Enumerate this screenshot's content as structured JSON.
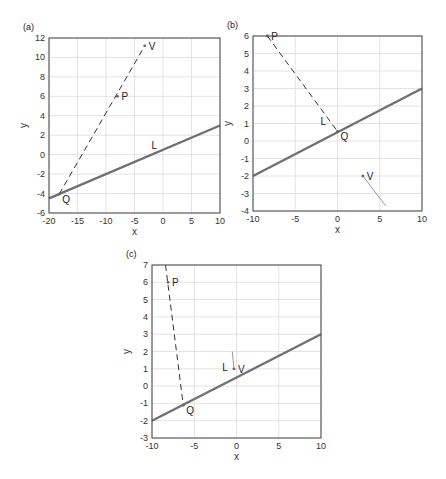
{
  "chart_data": [
    {
      "type": "line",
      "panel_label": "(a)",
      "xlabel": "x",
      "ylabel": "y",
      "xlim": [
        -20,
        10
      ],
      "ylim": [
        -6,
        12
      ],
      "xticks": [
        -20,
        -15,
        -10,
        -5,
        0,
        5,
        10
      ],
      "yticks": [
        -6,
        -4,
        -2,
        0,
        2,
        4,
        6,
        8,
        10,
        12
      ],
      "grid": true,
      "series": [
        {
          "name": "L",
          "style": "solid-thick",
          "color": "#707070",
          "points": [
            [
              -20,
              -4.5
            ],
            [
              10,
              3
            ]
          ]
        },
        {
          "name": "PQ",
          "style": "dashed",
          "color": "#333333",
          "points": [
            [
              -18.2,
              -4.05
            ],
            [
              -3.2,
              11.2
            ]
          ]
        }
      ],
      "annotations": [
        {
          "text": "V",
          "x": -3.2,
          "y": 11.2,
          "marker": true
        },
        {
          "text": "P",
          "x": -8,
          "y": 6,
          "marker": true
        },
        {
          "text": "L",
          "x": -2,
          "y": 0.6,
          "marker": false
        },
        {
          "text": "Q",
          "x": -18.2,
          "y": -4.05,
          "marker": true
        }
      ]
    },
    {
      "type": "line",
      "panel_label": "(b)",
      "xlabel": "x",
      "ylabel": "y",
      "xlim": [
        -10,
        10
      ],
      "ylim": [
        -4,
        6
      ],
      "xticks": [
        -10,
        -5,
        0,
        5,
        10
      ],
      "yticks": [
        -4,
        -3,
        -2,
        -1,
        0,
        1,
        2,
        3,
        4,
        5,
        6
      ],
      "grid": true,
      "series": [
        {
          "name": "L",
          "style": "solid-thick",
          "color": "#707070",
          "points": [
            [
              -10,
              -2
            ],
            [
              10,
              3
            ]
          ]
        },
        {
          "name": "PQ",
          "style": "dashed",
          "color": "#333333",
          "points": [
            [
              -8.3,
              6
            ],
            [
              0,
              0.55
            ]
          ]
        },
        {
          "name": "V-segment",
          "style": "solid-thin",
          "color": "#999999",
          "points": [
            [
              3,
              -2
            ],
            [
              5.7,
              -3.7
            ]
          ]
        }
      ],
      "annotations": [
        {
          "text": "P",
          "x": -8.3,
          "y": 6,
          "marker": true
        },
        {
          "text": "L",
          "x": -2,
          "y": 0.9,
          "marker": false
        },
        {
          "text": "Q",
          "x": 0,
          "y": 0.55,
          "marker": true
        },
        {
          "text": "V",
          "x": 3,
          "y": -2,
          "marker": true
        }
      ]
    },
    {
      "type": "line",
      "panel_label": "(c)",
      "xlabel": "x",
      "ylabel": "y",
      "xlim": [
        -10,
        10
      ],
      "ylim": [
        -3,
        7
      ],
      "xticks": [
        -10,
        -5,
        0,
        5,
        10
      ],
      "yticks": [
        -3,
        -2,
        -1,
        0,
        1,
        2,
        3,
        4,
        5,
        6,
        7
      ],
      "grid": true,
      "series": [
        {
          "name": "L",
          "style": "solid-thick",
          "color": "#707070",
          "points": [
            [
              -10,
              -2
            ],
            [
              10,
              3
            ]
          ]
        },
        {
          "name": "PQ",
          "style": "dashed",
          "color": "#333333",
          "points": [
            [
              -8.4,
              7
            ],
            [
              -6.3,
              -1.1
            ]
          ]
        },
        {
          "name": "V-segment",
          "style": "solid-thin",
          "color": "#999999",
          "points": [
            [
              -0.5,
              2
            ],
            [
              -0.3,
              1
            ]
          ]
        }
      ],
      "annotations": [
        {
          "text": "P",
          "x": -8.1,
          "y": 6,
          "marker": true
        },
        {
          "text": "L",
          "x": -1.7,
          "y": 0.85,
          "marker": false
        },
        {
          "text": "V",
          "x": -0.3,
          "y": 1,
          "marker": true
        },
        {
          "text": "Q",
          "x": -6.3,
          "y": -1.1,
          "marker": true
        }
      ]
    }
  ]
}
